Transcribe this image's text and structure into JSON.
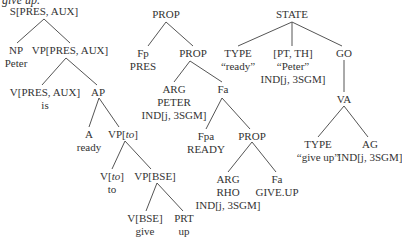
{
  "fragment": "give up.",
  "trees": [
    {
      "name": "syntax-tree",
      "nodes": [
        {
          "id": "s",
          "lines": [
            "S[PRES, AUX]"
          ]
        },
        {
          "id": "np",
          "lines": [
            "NP",
            "Peter"
          ]
        },
        {
          "id": "vp1",
          "lines": [
            "VP[PRES, AUX]"
          ]
        },
        {
          "id": "v1",
          "lines": [
            "V[PRES, AUX]",
            "is"
          ]
        },
        {
          "id": "ap",
          "lines": [
            "AP"
          ]
        },
        {
          "id": "a",
          "lines": [
            "A",
            "ready"
          ]
        },
        {
          "id": "vpto",
          "lines": [
            "VP[to]"
          ]
        },
        {
          "id": "vto",
          "lines": [
            "V[to]",
            "to"
          ]
        },
        {
          "id": "vpbse",
          "lines": [
            "VP[BSE]"
          ]
        },
        {
          "id": "vbse",
          "lines": [
            "V[BSE]",
            "give"
          ]
        },
        {
          "id": "prt",
          "lines": [
            "PRT",
            "up"
          ]
        }
      ]
    },
    {
      "name": "semantic-tree",
      "nodes": [
        {
          "id": "prop1",
          "lines": [
            "PROP"
          ]
        },
        {
          "id": "fp",
          "lines": [
            "Fp",
            "PRES"
          ]
        },
        {
          "id": "prop2",
          "lines": [
            "PROP"
          ]
        },
        {
          "id": "arg1",
          "lines": [
            "ARG",
            "PETER",
            "IND[j, 3SGM]"
          ]
        },
        {
          "id": "fa1",
          "lines": [
            "Fa"
          ]
        },
        {
          "id": "fpa",
          "lines": [
            "Fpa",
            "READY"
          ]
        },
        {
          "id": "prop3",
          "lines": [
            "PROP"
          ]
        },
        {
          "id": "arg2",
          "lines": [
            "ARG",
            "RHO",
            "IND[j, 3SGM]"
          ]
        },
        {
          "id": "fa2",
          "lines": [
            "Fa",
            "GIVE.UP"
          ]
        }
      ]
    },
    {
      "name": "conceptual-tree",
      "nodes": [
        {
          "id": "state",
          "lines": [
            "STATE"
          ]
        },
        {
          "id": "type1",
          "lines": [
            "TYPE",
            "“ready”"
          ]
        },
        {
          "id": "ptth",
          "lines": [
            "[PT, TH]",
            "“Peter”",
            "IND[j, 3SGM]"
          ]
        },
        {
          "id": "go",
          "lines": [
            "GO"
          ]
        },
        {
          "id": "va",
          "lines": [
            "VA"
          ]
        },
        {
          "id": "type2",
          "lines": [
            "TYPE",
            "“give up”"
          ]
        },
        {
          "id": "ag",
          "lines": [
            "AG",
            "IND[j, 3SGM]"
          ]
        }
      ]
    }
  ]
}
